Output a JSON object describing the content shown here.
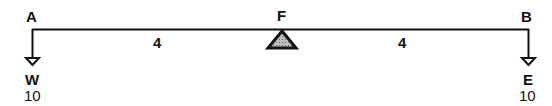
{
  "diagram": {
    "type": "lever-balance",
    "points": {
      "left": "A",
      "fulcrum": "F",
      "right": "B"
    },
    "distances": {
      "left_arm": "4",
      "right_arm": "4"
    },
    "loads": {
      "left": {
        "name": "W",
        "value": "10"
      },
      "right": {
        "name": "E",
        "value": "10"
      }
    },
    "colors": {
      "line": "#111111",
      "fulcrum_fill": "#999999"
    }
  }
}
